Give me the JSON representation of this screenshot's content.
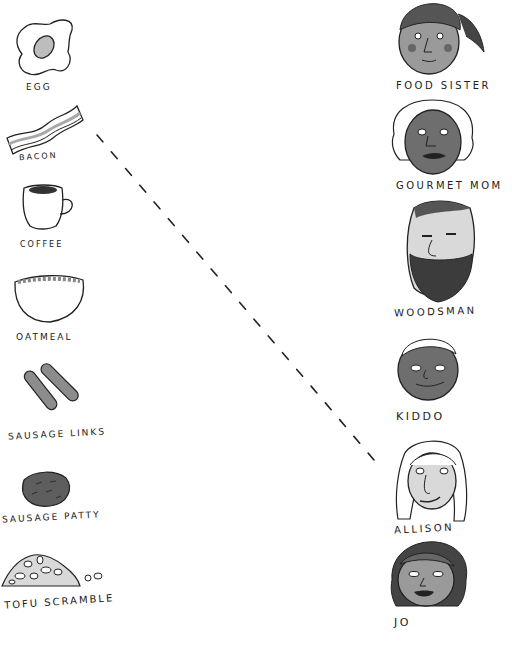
{
  "foods": [
    {
      "id": "egg",
      "label": "EGG"
    },
    {
      "id": "bacon",
      "label": "BACON"
    },
    {
      "id": "coffee",
      "label": "COFFEE"
    },
    {
      "id": "oatmeal",
      "label": "OATMEAL"
    },
    {
      "id": "sausage-links",
      "label": "SAUSAGE LINKS"
    },
    {
      "id": "sausage-patty",
      "label": "SAUSAGE PATTY"
    },
    {
      "id": "tofu-scramble",
      "label": "TOFU SCRAMBLE"
    }
  ],
  "people": [
    {
      "id": "food-sister",
      "label": "FOOD SISTER"
    },
    {
      "id": "gourmet-mom",
      "label": "GOURMET MOM"
    },
    {
      "id": "woodsman",
      "label": "WOODSMAN"
    },
    {
      "id": "kiddo",
      "label": "KIDDO"
    },
    {
      "id": "allison",
      "label": "ALLISON"
    },
    {
      "id": "jo",
      "label": "JO"
    }
  ],
  "connections": [
    {
      "from": "BACON",
      "to": "ALLISON",
      "style": "dashed"
    }
  ],
  "colors": {
    "ink": "#222222",
    "skin_light": "#d9d9d9",
    "skin_mid": "#9a9a9a",
    "skin_dark": "#6e6e6e",
    "bacon_stripe": "#a8a8a8",
    "sausage": "#8c8c8c",
    "patty": "#5e5e5e"
  }
}
